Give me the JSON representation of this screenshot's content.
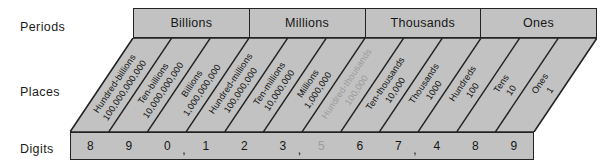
{
  "diagram": {
    "row_labels": {
      "periods": "Periods",
      "places": "Places",
      "digits": "Digits"
    },
    "colors": {
      "cell_fill": "#c2c2c2",
      "stroke": "#232323",
      "text": "#161616",
      "faded_text": "#9b9b9b"
    },
    "periods": [
      {
        "label": "Billions"
      },
      {
        "label": "Millions"
      },
      {
        "label": "Thousands"
      },
      {
        "label": "Ones"
      }
    ],
    "places": [
      {
        "name": "Hundred-billions",
        "value": "100,000,000,000",
        "faded": false
      },
      {
        "name": "Ten-billions",
        "value": "10,000,000,000",
        "faded": false
      },
      {
        "name": "Billions",
        "value": "1,000,000,000",
        "faded": false
      },
      {
        "name": "Hundred-millions",
        "value": "100,000,000",
        "faded": false
      },
      {
        "name": "Ten-millions",
        "value": "10,000,000",
        "faded": false
      },
      {
        "name": "Millions",
        "value": "1,000,000",
        "faded": false
      },
      {
        "name": "Hundred-thousands",
        "value": "100,000",
        "faded": true
      },
      {
        "name": "Ten-thousands",
        "value": "10,000",
        "faded": false
      },
      {
        "name": "Thousands",
        "value": "1000",
        "faded": false
      },
      {
        "name": "Hundreds",
        "value": "100",
        "faded": false
      },
      {
        "name": "Tens",
        "value": "10",
        "faded": false
      },
      {
        "name": "Ones",
        "value": "1",
        "faded": false
      }
    ],
    "digits": [
      {
        "digit": "8",
        "comma": false,
        "faded": false
      },
      {
        "digit": "9",
        "comma": false,
        "faded": false
      },
      {
        "digit": "0",
        "comma": true,
        "faded": false
      },
      {
        "digit": "1",
        "comma": false,
        "faded": false
      },
      {
        "digit": "2",
        "comma": false,
        "faded": false
      },
      {
        "digit": "3",
        "comma": true,
        "faded": false
      },
      {
        "digit": "5",
        "comma": false,
        "faded": true
      },
      {
        "digit": "6",
        "comma": false,
        "faded": false
      },
      {
        "digit": "7",
        "comma": true,
        "faded": false
      },
      {
        "digit": "4",
        "comma": false,
        "faded": false
      },
      {
        "digit": "8",
        "comma": false,
        "faded": false
      },
      {
        "digit": "9",
        "comma": false,
        "faded": false
      }
    ]
  }
}
